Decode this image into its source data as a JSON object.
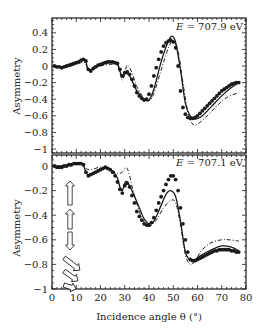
{
  "chart_data": [
    {
      "type": "scatter",
      "panel": "top",
      "annotation": "E = 707.9 eV",
      "annotation_parts": {
        "var": "E",
        "rest": " = 707.9 eV"
      },
      "xlabel": "Incidence angle θ (°)",
      "ylabel": "Asymmetry",
      "xlim": [
        0,
        80
      ],
      "ylim": [
        -1.05,
        0.55
      ],
      "yticks": [
        0.4,
        0.2,
        0,
        -0.2,
        -0.4,
        -0.6,
        -0.8,
        -1
      ],
      "ytick_labels": [
        "0.4",
        "0.2",
        "0",
        "−0.2",
        "−0.4",
        "−0.6",
        "−0.8",
        "−1"
      ],
      "series": [
        {
          "name": "measured",
          "style": "filled-circles",
          "x": [
            1,
            2,
            3,
            4,
            5,
            6,
            7,
            8,
            9,
            10,
            11,
            12,
            13,
            14,
            15,
            16,
            17,
            18,
            19,
            20,
            21,
            22,
            23,
            24,
            25,
            26,
            27,
            28,
            29,
            30,
            31,
            32,
            33,
            34,
            35,
            36,
            37,
            38,
            39,
            40,
            41,
            42,
            43,
            44,
            45,
            46,
            47,
            48,
            49,
            50,
            51,
            52,
            53,
            54,
            55,
            56,
            57,
            58,
            59,
            60,
            61,
            62,
            63,
            64,
            65,
            66,
            67,
            68,
            69,
            70,
            71,
            72,
            73,
            74,
            75,
            76,
            77
          ],
          "y": [
            0.0,
            -0.01,
            -0.01,
            -0.02,
            -0.01,
            0.0,
            0.01,
            0.02,
            0.03,
            0.04,
            0.05,
            0.07,
            0.08,
            0.06,
            -0.04,
            -0.06,
            -0.03,
            -0.01,
            0.01,
            0.02,
            0.03,
            0.04,
            0.05,
            0.05,
            0.05,
            0.04,
            0.03,
            -0.04,
            -0.12,
            -0.08,
            -0.07,
            -0.1,
            -0.16,
            -0.24,
            -0.32,
            -0.36,
            -0.39,
            -0.41,
            -0.4,
            -0.34,
            -0.24,
            -0.12,
            -0.02,
            0.08,
            0.17,
            0.24,
            0.28,
            0.3,
            0.31,
            0.29,
            0.22,
            0.0,
            -0.3,
            -0.5,
            -0.58,
            -0.62,
            -0.63,
            -0.63,
            -0.62,
            -0.6,
            -0.57,
            -0.54,
            -0.51,
            -0.48,
            -0.45,
            -0.42,
            -0.39,
            -0.36,
            -0.33,
            -0.3,
            -0.28,
            -0.26,
            -0.24,
            -0.22,
            -0.21,
            -0.2,
            -0.2
          ]
        },
        {
          "name": "calculation (solid)",
          "style": "solid",
          "x": [
            0,
            5,
            10,
            12,
            13,
            14,
            15,
            17,
            20,
            24,
            27,
            28,
            29,
            30,
            32,
            35,
            38,
            40,
            42,
            45,
            48,
            49.5,
            51,
            53,
            55,
            57,
            59,
            62,
            66,
            70,
            74,
            77
          ],
          "y": [
            0.0,
            -0.01,
            0.04,
            0.07,
            0.08,
            0.05,
            -0.05,
            -0.03,
            0.02,
            0.04,
            0.02,
            -0.06,
            -0.13,
            -0.09,
            -0.12,
            -0.3,
            -0.4,
            -0.41,
            -0.28,
            0.05,
            0.3,
            0.36,
            0.28,
            -0.05,
            -0.45,
            -0.6,
            -0.64,
            -0.6,
            -0.48,
            -0.36,
            -0.26,
            -0.2
          ]
        },
        {
          "name": "calculation (dash-dot)",
          "style": "dash-dot",
          "x": [
            0,
            5,
            10,
            13,
            14,
            15,
            17,
            20,
            24,
            27,
            28,
            29,
            30,
            31,
            33,
            35,
            38,
            40,
            42,
            45,
            48,
            50,
            52,
            54,
            56,
            58,
            60,
            64,
            68,
            72,
            77
          ],
          "y": [
            0.0,
            -0.02,
            0.02,
            0.05,
            0.02,
            -0.04,
            -0.04,
            0.0,
            0.02,
            0.01,
            -0.08,
            -0.17,
            -0.1,
            0.01,
            -0.08,
            -0.25,
            -0.39,
            -0.42,
            -0.33,
            -0.05,
            0.22,
            0.3,
            0.18,
            -0.2,
            -0.55,
            -0.7,
            -0.7,
            -0.6,
            -0.48,
            -0.38,
            -0.32
          ]
        }
      ]
    },
    {
      "type": "scatter",
      "panel": "bottom",
      "annotation": "E = 707.1 eV",
      "annotation_parts": {
        "var": "E",
        "rest": " = 707.1 eV"
      },
      "xlabel": "Incidence angle θ (°)",
      "ylabel": "Asymmetry",
      "xlim": [
        0,
        80
      ],
      "ylim": [
        -1,
        0.09
      ],
      "xticks": [
        0,
        10,
        20,
        30,
        40,
        50,
        60,
        70,
        80
      ],
      "yticks": [
        0,
        -0.2,
        -0.4,
        -0.6,
        -0.8,
        -1
      ],
      "ytick_labels": [
        "0",
        "−0.2",
        "−0.4",
        "−0.6",
        "−0.8",
        "−1"
      ],
      "series": [
        {
          "name": "measured",
          "style": "filled-circles",
          "x": [
            1,
            2,
            3,
            4,
            5,
            6,
            7,
            8,
            9,
            10,
            11,
            12,
            13,
            14,
            15,
            16,
            17,
            18,
            19,
            20,
            21,
            22,
            23,
            24,
            25,
            26,
            27,
            28,
            29,
            30,
            31,
            32,
            33,
            34,
            35,
            36,
            37,
            38,
            39,
            40,
            41,
            42,
            43,
            44,
            45,
            46,
            47,
            48,
            49,
            50,
            51,
            52,
            53,
            54,
            55,
            56,
            57,
            58,
            59,
            60,
            61,
            62,
            63,
            64,
            65,
            66,
            67,
            68,
            69,
            70,
            71,
            72,
            73,
            74,
            75,
            76,
            77
          ],
          "y": [
            0.0,
            -0.01,
            -0.01,
            -0.01,
            0.0,
            0.0,
            0.01,
            0.01,
            0.02,
            0.02,
            0.02,
            0.02,
            0.01,
            -0.05,
            -0.08,
            -0.07,
            -0.06,
            -0.05,
            -0.04,
            -0.03,
            -0.02,
            -0.01,
            -0.02,
            -0.03,
            -0.05,
            -0.08,
            -0.13,
            -0.19,
            -0.22,
            -0.16,
            -0.14,
            -0.17,
            -0.24,
            -0.3,
            -0.37,
            -0.41,
            -0.44,
            -0.47,
            -0.48,
            -0.48,
            -0.46,
            -0.42,
            -0.36,
            -0.3,
            -0.25,
            -0.2,
            -0.15,
            -0.11,
            -0.08,
            -0.08,
            -0.11,
            -0.2,
            -0.34,
            -0.47,
            -0.6,
            -0.7,
            -0.76,
            -0.77,
            -0.77,
            -0.76,
            -0.75,
            -0.74,
            -0.73,
            -0.72,
            -0.71,
            -0.7,
            -0.69,
            -0.69,
            -0.68,
            -0.68,
            -0.68,
            -0.68,
            -0.68,
            -0.69,
            -0.69,
            -0.7,
            -0.7
          ]
        },
        {
          "name": "calculation (solid)",
          "style": "solid",
          "x": [
            0,
            5,
            10,
            12,
            13,
            14,
            15,
            18,
            22,
            25,
            27,
            28,
            29,
            30,
            31,
            33,
            36,
            38,
            40,
            42,
            45,
            47,
            49,
            51,
            53,
            55,
            57,
            59,
            62,
            66,
            70,
            74,
            77
          ],
          "y": [
            0.0,
            0.0,
            0.02,
            0.02,
            0.0,
            -0.05,
            -0.07,
            -0.05,
            -0.02,
            -0.04,
            -0.1,
            -0.17,
            -0.2,
            -0.14,
            -0.13,
            -0.2,
            -0.34,
            -0.43,
            -0.47,
            -0.45,
            -0.32,
            -0.23,
            -0.2,
            -0.25,
            -0.45,
            -0.7,
            -0.76,
            -0.76,
            -0.72,
            -0.68,
            -0.65,
            -0.66,
            -0.69
          ]
        },
        {
          "name": "calculation (dash-dot)",
          "style": "dash-dot",
          "x": [
            0,
            5,
            10,
            13,
            14,
            16,
            20,
            24,
            27,
            29,
            30,
            31,
            32,
            34,
            37,
            40,
            43,
            46,
            49,
            51,
            53,
            55,
            57,
            59,
            62,
            66,
            70,
            73,
            77
          ],
          "y": [
            0.0,
            0.0,
            0.02,
            0.01,
            -0.02,
            -0.03,
            -0.01,
            -0.03,
            -0.06,
            -0.05,
            -0.02,
            -0.02,
            -0.08,
            -0.24,
            -0.42,
            -0.49,
            -0.44,
            -0.34,
            -0.28,
            -0.3,
            -0.48,
            -0.72,
            -0.8,
            -0.77,
            -0.68,
            -0.62,
            -0.6,
            -0.6,
            -0.61
          ]
        }
      ]
    }
  ],
  "arrows": [
    {
      "label": "up-arrow-1",
      "dir": "up"
    },
    {
      "label": "up-arrow-2",
      "dir": "up"
    },
    {
      "label": "down-arrow",
      "dir": "down"
    },
    {
      "label": "diag-arrow-1",
      "dir": "down-right"
    },
    {
      "label": "diag-arrow-2",
      "dir": "down-right"
    },
    {
      "label": "diag-arrow-3",
      "dir": "right-slight"
    }
  ],
  "colors": {
    "ink": "#1a1a1a",
    "background": "#ffffff"
  }
}
